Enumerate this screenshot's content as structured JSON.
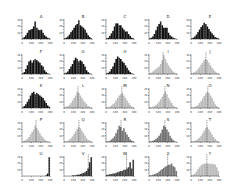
{
  "chart_data": [
    {
      "type": "bar",
      "title": "A",
      "color": "#111111",
      "values": [
        1,
        3,
        6,
        10,
        14,
        15,
        16,
        20,
        28,
        18,
        15,
        14,
        15,
        10,
        6,
        4,
        2,
        1
      ],
      "median": 150
    },
    {
      "type": "bar",
      "title": "B",
      "color": "#111111",
      "values": [
        1,
        2,
        4,
        7,
        11,
        14,
        18,
        22,
        24,
        30,
        22,
        20,
        18,
        15,
        10,
        6,
        3,
        1
      ],
      "median": 160
    },
    {
      "type": "bar",
      "title": "C",
      "color": "#111111",
      "values": [
        1,
        2,
        5,
        9,
        13,
        20,
        25,
        25,
        22,
        22,
        18,
        15,
        12,
        12,
        8,
        5,
        2,
        1
      ],
      "median": 140
    },
    {
      "type": "bar",
      "title": "D",
      "color": "#111111",
      "values": [
        1,
        2,
        4,
        8,
        14,
        20,
        24,
        28,
        22,
        18,
        18,
        18,
        10,
        6,
        4,
        2,
        1,
        0
      ],
      "median": 130
    },
    {
      "type": "bar",
      "title": "E",
      "color": "#111111",
      "values": [
        1,
        2,
        4,
        7,
        11,
        15,
        19,
        22,
        26,
        24,
        20,
        16,
        12,
        9,
        6,
        3,
        2,
        1
      ],
      "median": 150
    },
    {
      "type": "bar",
      "title": "F",
      "color": "#111111",
      "values": [
        1,
        3,
        8,
        14,
        20,
        22,
        18,
        22,
        24,
        22,
        20,
        18,
        14,
        12,
        6,
        3,
        1,
        0
      ],
      "median": 140
    },
    {
      "type": "bar",
      "title": "G",
      "color": "#111111",
      "values": [
        1,
        2,
        4,
        8,
        12,
        16,
        22,
        26,
        24,
        20,
        22,
        20,
        16,
        12,
        6,
        3,
        1,
        0
      ],
      "median": 150
    },
    {
      "type": "bar",
      "title": "H",
      "color": "#111111",
      "values": [
        1,
        2,
        4,
        8,
        12,
        18,
        24,
        28,
        26,
        24,
        20,
        18,
        14,
        10,
        6,
        3,
        1,
        0
      ],
      "median": 140
    },
    {
      "type": "bar",
      "title": "I",
      "color": "#bbbbbb",
      "values": [
        1,
        2,
        4,
        6,
        8,
        10,
        12,
        16,
        22,
        30,
        24,
        18,
        14,
        10,
        7,
        4,
        2,
        1
      ],
      "median": 150
    },
    {
      "type": "bar",
      "title": "J",
      "color": "#bbbbbb",
      "values": [
        1,
        2,
        3,
        5,
        8,
        11,
        15,
        18,
        22,
        24,
        22,
        18,
        14,
        10,
        7,
        4,
        2,
        1
      ],
      "median": 160
    },
    {
      "type": "bar",
      "title": "K",
      "color": "#111111",
      "values": [
        1,
        3,
        6,
        10,
        14,
        20,
        24,
        26,
        22,
        24,
        22,
        20,
        18,
        16,
        12,
        8,
        4,
        2
      ],
      "median": 150
    },
    {
      "type": "bar",
      "title": "L",
      "color": "#bbbbbb",
      "values": [
        1,
        2,
        3,
        5,
        8,
        12,
        16,
        20,
        26,
        24,
        20,
        16,
        12,
        9,
        6,
        3,
        2,
        1
      ],
      "median": 150
    },
    {
      "type": "bar",
      "title": "M",
      "color": "#bbbbbb",
      "values": [
        1,
        1,
        2,
        4,
        6,
        8,
        12,
        16,
        20,
        22,
        24,
        20,
        16,
        12,
        8,
        5,
        2,
        1
      ],
      "median": 170
    },
    {
      "type": "bar",
      "title": "N",
      "color": "#bbbbbb",
      "values": [
        1,
        1,
        2,
        3,
        5,
        7,
        10,
        14,
        18,
        22,
        26,
        22,
        16,
        12,
        8,
        4,
        2,
        1
      ],
      "median": 170
    },
    {
      "type": "bar",
      "title": "O",
      "color": "#bbbbbb",
      "values": [
        1,
        1,
        2,
        3,
        5,
        8,
        11,
        15,
        19,
        23,
        26,
        24,
        20,
        16,
        11,
        6,
        3,
        1
      ],
      "median": 180
    },
    {
      "type": "bar",
      "title": "P",
      "color": "#bbbbbb",
      "values": [
        1,
        2,
        3,
        5,
        8,
        12,
        16,
        20,
        26,
        22,
        18,
        14,
        10,
        7,
        4,
        2,
        1,
        0
      ],
      "median": 150
    },
    {
      "type": "bar",
      "title": "Q",
      "color": "#bbbbbb",
      "values": [
        1,
        1,
        2,
        4,
        6,
        9,
        13,
        17,
        21,
        24,
        22,
        18,
        14,
        10,
        6,
        3,
        2,
        1
      ],
      "median": 160
    },
    {
      "type": "bar",
      "title": "R",
      "color": "#777777",
      "values": [
        1,
        1,
        2,
        4,
        6,
        9,
        14,
        20,
        26,
        24,
        18,
        22,
        16,
        12,
        8,
        4,
        2,
        1
      ],
      "median": 160
    },
    {
      "type": "bar",
      "title": "S",
      "color": "#777777",
      "values": [
        1,
        1,
        2,
        3,
        5,
        7,
        10,
        14,
        20,
        26,
        24,
        20,
        16,
        10,
        6,
        3,
        1,
        0
      ],
      "median": 170
    },
    {
      "type": "bar",
      "title": "T",
      "color": "#bbbbbb",
      "values": [
        1,
        1,
        2,
        3,
        5,
        7,
        10,
        14,
        18,
        22,
        24,
        20,
        16,
        12,
        8,
        5,
        2,
        1
      ],
      "median": 170
    },
    {
      "type": "bar",
      "title": "U",
      "color": "#111111",
      "values": [
        0,
        0,
        0,
        0,
        0,
        0,
        0,
        0,
        0,
        0,
        0,
        0,
        0,
        0,
        0,
        1,
        4,
        30
      ],
      "median": 290
    },
    {
      "type": "bar",
      "title": "V",
      "color": "#333333",
      "values": [
        0,
        0,
        0,
        0,
        0,
        1,
        1,
        1,
        2,
        2,
        3,
        4,
        5,
        6,
        8,
        12,
        22,
        30
      ],
      "median": 260
    },
    {
      "type": "bar",
      "title": "W",
      "color": "#444444",
      "values": [
        2,
        2,
        3,
        3,
        4,
        4,
        5,
        6,
        7,
        8,
        8,
        10,
        10,
        12,
        14,
        22,
        12,
        26
      ],
      "median": 220
    },
    {
      "type": "bar",
      "title": "X",
      "color": "#777777",
      "values": [
        1,
        1,
        2,
        3,
        4,
        5,
        7,
        9,
        11,
        13,
        15,
        16,
        18,
        18,
        20,
        16,
        14,
        8
      ],
      "median": 200
    },
    {
      "type": "bar",
      "title": "Y",
      "color": "#bbbbbb",
      "values": [
        1,
        2,
        4,
        7,
        11,
        14,
        17,
        19,
        20,
        20,
        20,
        20,
        19,
        20,
        19,
        18,
        14,
        8
      ],
      "median": 170
    }
  ],
  "axes": {
    "xticks": [
      "0",
      "100",
      "200",
      "300"
    ],
    "yticks": [
      "10",
      "20",
      "30"
    ],
    "xlim": [
      0,
      300
    ],
    "ylim": [
      0,
      32
    ]
  }
}
